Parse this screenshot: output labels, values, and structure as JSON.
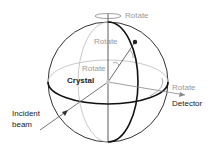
{
  "diagram": {
    "type": "goniometer-sphere",
    "labels": {
      "rotate_top": "Rotate",
      "rotate_upper": "Rotate",
      "rotate_middle": "Rotate",
      "rotate_right": "Rotate",
      "crystal": "Crystal",
      "detector": "Detector",
      "incident_line1": "Incident",
      "incident_line2": "beam"
    },
    "colors": {
      "dark_line": "#222222",
      "light_line": "#aaaaaa",
      "gray_text": "#999999",
      "dark_text": "#222222"
    }
  }
}
